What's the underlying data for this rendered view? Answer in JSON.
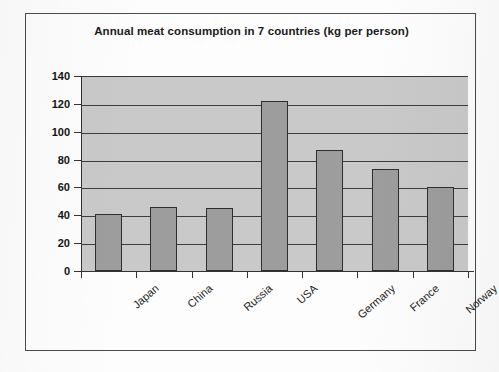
{
  "chart_data": {
    "type": "bar",
    "title": "Annual meat consumption in 7 countries (kg per person)",
    "categories": [
      "Japan",
      "China",
      "Russia",
      "USA",
      "Germany",
      "France",
      "Norway"
    ],
    "values": [
      41,
      46,
      45,
      122,
      87,
      73,
      60
    ],
    "xlabel": "",
    "ylabel": "",
    "ylim": [
      0,
      140
    ],
    "ytick_step": 20,
    "yticks": [
      "140",
      "120",
      "100",
      "80",
      "60",
      "40",
      "20",
      "0"
    ],
    "ytick_values": [
      140,
      120,
      100,
      80,
      60,
      40,
      20,
      0
    ],
    "grid": "horizontal",
    "legend": "none",
    "series": [
      {
        "name": "Annual meat consumption",
        "unit": "kg per person",
        "values": [
          41,
          46,
          45,
          122,
          87,
          73,
          60
        ]
      }
    ],
    "colors": {
      "bar_fill": "#9d9d9d",
      "bar_stroke": "#2e2e2e",
      "plot_background": "#c9c9c9",
      "gridline": "#3d3d3d",
      "axis": "#333333",
      "text": "#141414",
      "frame": "#4a4a4a",
      "page_background": "#fdfdfd"
    }
  }
}
